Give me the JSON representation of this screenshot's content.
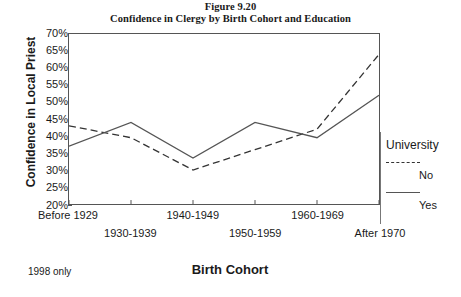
{
  "figure": {
    "title_line1": "Figure 9.20",
    "title_line2": "Confidence in Clergy by Birth Cohort and Education",
    "note": "1998 only"
  },
  "legend": {
    "title": "University",
    "items": [
      {
        "label": "No",
        "style": "dashed"
      },
      {
        "label": "Yes",
        "style": "solid"
      }
    ]
  },
  "chart_data": {
    "type": "line",
    "title": "Confidence in Clergy by Birth Cohort and Education",
    "xlabel": "Birth Cohort",
    "ylabel": "Confidence in Local Priest",
    "categories": [
      "Before 1929",
      "1930-1939",
      "1940-1949",
      "1950-1959",
      "1960-1969",
      "After 1970"
    ],
    "ytick_labels": [
      "70%",
      "65%",
      "60%",
      "55%",
      "50%",
      "45%",
      "40%",
      "35%",
      "30%",
      "25%",
      "20%"
    ],
    "ytick_values": [
      70,
      65,
      60,
      55,
      50,
      45,
      40,
      35,
      30,
      25,
      20
    ],
    "ylim": [
      20,
      70
    ],
    "grid": false,
    "legend_position": "right",
    "series": [
      {
        "name": "No",
        "style": "dashed",
        "color": "#333333",
        "values": [
          43.0,
          39.5,
          30.0,
          36.0,
          42.0,
          64.0
        ]
      },
      {
        "name": "Yes",
        "style": "solid",
        "color": "#555555",
        "values": [
          37.0,
          44.0,
          33.5,
          44.0,
          39.5,
          52.0
        ]
      }
    ]
  }
}
